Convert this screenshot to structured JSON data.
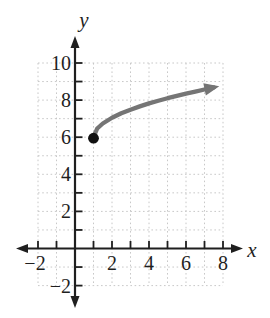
{
  "figure": {
    "background": "#ffffff",
    "width_px": 270,
    "height_px": 318
  },
  "chart_data": {
    "type": "line",
    "title": "",
    "xlabel": "x",
    "ylabel": "y",
    "xlim": [
      -2.9,
      9.3
    ],
    "ylim": [
      -3.3,
      11.4
    ],
    "grid": {
      "visible": true,
      "style": "dotted",
      "color": "#c8c8c8",
      "x_lines": [
        -2,
        -1,
        0,
        1,
        2,
        3,
        4,
        5,
        6,
        7,
        8
      ],
      "y_lines": [
        -2,
        -1,
        0,
        1,
        2,
        3,
        4,
        5,
        6,
        7,
        8,
        9,
        10
      ]
    },
    "axis_color": "#1f1f1f",
    "x_ticks": [
      -2,
      -1,
      1,
      2,
      3,
      4,
      5,
      6,
      7,
      8
    ],
    "y_ticks": [
      -2,
      -1,
      1,
      2,
      3,
      4,
      5,
      6,
      7,
      8,
      9,
      10
    ],
    "x_tick_labels": [
      {
        "value": -2,
        "label": "−2"
      },
      {
        "value": 2,
        "label": "2"
      },
      {
        "value": 4,
        "label": "4"
      },
      {
        "value": 6,
        "label": "6"
      },
      {
        "value": 8,
        "label": "8"
      }
    ],
    "y_tick_labels": [
      {
        "value": 10,
        "label": "10"
      },
      {
        "value": 8,
        "label": "8"
      },
      {
        "value": 6,
        "label": "6"
      },
      {
        "value": 4,
        "label": "4"
      },
      {
        "value": 2,
        "label": "2"
      },
      {
        "value": -2,
        "label": "−2"
      }
    ],
    "series": [
      {
        "name": "square-root-curve",
        "description": "Curve starting at closed point (1, 6), increasing and flattening rightward, ending in an arrow near (7.8, 8.8); shape of y = 6 + sqrt(x − 1)",
        "color": "#757575",
        "stroke_width": 4.3,
        "start_point": {
          "x": 1,
          "y": 6,
          "closed_dot": true,
          "dot_color": "#111111",
          "dot_radius_px": 5.4
        },
        "end_arrow": true,
        "points": [
          [
            1,
            6
          ],
          [
            1.2,
            6.47
          ],
          [
            1.5,
            6.74
          ],
          [
            2,
            7.05
          ],
          [
            2.5,
            7.29
          ],
          [
            3,
            7.48
          ],
          [
            3.5,
            7.66
          ],
          [
            4,
            7.82
          ],
          [
            4.5,
            7.96
          ],
          [
            5,
            8.1
          ],
          [
            5.5,
            8.23
          ],
          [
            6,
            8.35
          ],
          [
            6.5,
            8.46
          ],
          [
            7,
            8.57
          ],
          [
            7.5,
            8.68
          ],
          [
            7.8,
            8.74
          ]
        ]
      }
    ],
    "layout": {
      "origin_px": [
        75,
        248.5
      ],
      "unit_px_x": 18.5,
      "unit_px_y": 18.55,
      "x_axis_px": {
        "line_start": 21,
        "line_end": 237,
        "arrow_left_tip": 16,
        "arrow_right_tip": 243
      },
      "y_axis_px": {
        "line_start": 41,
        "line_end": 303,
        "arrow_top_tip": 36,
        "arrow_bottom_tip": 308
      },
      "grid_span_x": [
        -2,
        8
      ],
      "grid_span_y": [
        -2,
        10
      ],
      "xlabel_pos_px": [
        252,
        257
      ],
      "ylabel_pos_px": [
        84,
        27
      ],
      "tick_len_px": 7.5,
      "tick_stroke": 1.8,
      "axis_stroke": 2.2,
      "x_tick_label_baseline_px": 270,
      "y_tick_label_right_px": 71,
      "tick_font_px": 20,
      "axis_letter_font_px": 21,
      "arrowhead_len_px": 12,
      "arrowhead_halfwidth_px": 4.5,
      "curve_arrowhead_len_px": 15,
      "curve_arrowhead_halfwidth_px": 6.3
    }
  }
}
